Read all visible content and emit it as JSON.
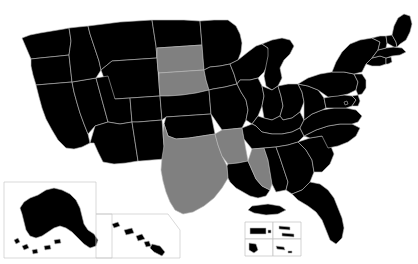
{
  "figure": {
    "type": "choropleth-map",
    "region": "United States",
    "width": 418,
    "height": 264,
    "background_color": "#ffffff",
    "border_color": "#b8b8b8"
  },
  "legend": {
    "categories": [
      {
        "key": "highlighted",
        "color": "#808080",
        "count": 5
      },
      {
        "key": "default",
        "color": "#000000",
        "count": 46
      }
    ]
  },
  "map_data": {
    "type": "choropleth",
    "value_colors": {
      "highlighted": "#808080",
      "default": "#000000"
    },
    "highlighted_states": [
      "South Dakota",
      "Nebraska",
      "Texas",
      "Arkansas",
      "Mississippi"
    ],
    "states": [
      {
        "code": "WA",
        "name": "Washington",
        "value": "default",
        "color": "#000000"
      },
      {
        "code": "OR",
        "name": "Oregon",
        "value": "default",
        "color": "#000000"
      },
      {
        "code": "CA",
        "name": "California",
        "value": "default",
        "color": "#000000"
      },
      {
        "code": "NV",
        "name": "Nevada",
        "value": "default",
        "color": "#000000"
      },
      {
        "code": "ID",
        "name": "Idaho",
        "value": "default",
        "color": "#000000"
      },
      {
        "code": "MT",
        "name": "Montana",
        "value": "default",
        "color": "#000000"
      },
      {
        "code": "WY",
        "name": "Wyoming",
        "value": "default",
        "color": "#000000"
      },
      {
        "code": "UT",
        "name": "Utah",
        "value": "default",
        "color": "#000000"
      },
      {
        "code": "AZ",
        "name": "Arizona",
        "value": "default",
        "color": "#000000"
      },
      {
        "code": "CO",
        "name": "Colorado",
        "value": "default",
        "color": "#000000"
      },
      {
        "code": "NM",
        "name": "New Mexico",
        "value": "default",
        "color": "#000000"
      },
      {
        "code": "ND",
        "name": "North Dakota",
        "value": "default",
        "color": "#000000"
      },
      {
        "code": "SD",
        "name": "South Dakota",
        "value": "highlighted",
        "color": "#808080"
      },
      {
        "code": "NE",
        "name": "Nebraska",
        "value": "highlighted",
        "color": "#808080"
      },
      {
        "code": "KS",
        "name": "Kansas",
        "value": "default",
        "color": "#000000"
      },
      {
        "code": "OK",
        "name": "Oklahoma",
        "value": "default",
        "color": "#000000"
      },
      {
        "code": "TX",
        "name": "Texas",
        "value": "highlighted",
        "color": "#808080"
      },
      {
        "code": "MN",
        "name": "Minnesota",
        "value": "default",
        "color": "#000000"
      },
      {
        "code": "IA",
        "name": "Iowa",
        "value": "default",
        "color": "#000000"
      },
      {
        "code": "MO",
        "name": "Missouri",
        "value": "default",
        "color": "#000000"
      },
      {
        "code": "AR",
        "name": "Arkansas",
        "value": "highlighted",
        "color": "#808080"
      },
      {
        "code": "LA",
        "name": "Louisiana",
        "value": "default",
        "color": "#000000"
      },
      {
        "code": "WI",
        "name": "Wisconsin",
        "value": "default",
        "color": "#000000"
      },
      {
        "code": "IL",
        "name": "Illinois",
        "value": "default",
        "color": "#000000"
      },
      {
        "code": "MI",
        "name": "Michigan",
        "value": "default",
        "color": "#000000"
      },
      {
        "code": "IN",
        "name": "Indiana",
        "value": "default",
        "color": "#000000"
      },
      {
        "code": "OH",
        "name": "Ohio",
        "value": "default",
        "color": "#000000"
      },
      {
        "code": "KY",
        "name": "Kentucky",
        "value": "default",
        "color": "#000000"
      },
      {
        "code": "TN",
        "name": "Tennessee",
        "value": "default",
        "color": "#000000"
      },
      {
        "code": "MS",
        "name": "Mississippi",
        "value": "highlighted",
        "color": "#808080"
      },
      {
        "code": "AL",
        "name": "Alabama",
        "value": "default",
        "color": "#000000"
      },
      {
        "code": "GA",
        "name": "Georgia",
        "value": "default",
        "color": "#000000"
      },
      {
        "code": "FL",
        "name": "Florida",
        "value": "default",
        "color": "#000000"
      },
      {
        "code": "SC",
        "name": "South Carolina",
        "value": "default",
        "color": "#000000"
      },
      {
        "code": "NC",
        "name": "North Carolina",
        "value": "default",
        "color": "#000000"
      },
      {
        "code": "VA",
        "name": "Virginia",
        "value": "default",
        "color": "#000000"
      },
      {
        "code": "WV",
        "name": "West Virginia",
        "value": "default",
        "color": "#000000"
      },
      {
        "code": "MD",
        "name": "Maryland",
        "value": "default",
        "color": "#000000"
      },
      {
        "code": "DE",
        "name": "Delaware",
        "value": "default",
        "color": "#000000"
      },
      {
        "code": "PA",
        "name": "Pennsylvania",
        "value": "default",
        "color": "#000000"
      },
      {
        "code": "NJ",
        "name": "New Jersey",
        "value": "default",
        "color": "#000000"
      },
      {
        "code": "NY",
        "name": "New York",
        "value": "default",
        "color": "#000000"
      },
      {
        "code": "CT",
        "name": "Connecticut",
        "value": "default",
        "color": "#000000"
      },
      {
        "code": "RI",
        "name": "Rhode Island",
        "value": "default",
        "color": "#000000"
      },
      {
        "code": "MA",
        "name": "Massachusetts",
        "value": "default",
        "color": "#000000"
      },
      {
        "code": "VT",
        "name": "Vermont",
        "value": "default",
        "color": "#000000"
      },
      {
        "code": "NH",
        "name": "New Hampshire",
        "value": "default",
        "color": "#000000"
      },
      {
        "code": "ME",
        "name": "Maine",
        "value": "default",
        "color": "#000000"
      },
      {
        "code": "AK",
        "name": "Alaska",
        "value": "default",
        "color": "#000000"
      },
      {
        "code": "HI",
        "name": "Hawaii",
        "value": "default",
        "color": "#000000"
      },
      {
        "code": "DC",
        "name": "District of Columbia",
        "value": "default",
        "color": "#000000"
      }
    ],
    "insets": [
      {
        "key": "alaska",
        "name": "Alaska",
        "color": "#000000"
      },
      {
        "key": "hawaii",
        "name": "Hawaii",
        "color": "#000000"
      },
      {
        "key": "territories",
        "name": "Territories",
        "color": "#000000",
        "cells": 6
      }
    ]
  }
}
